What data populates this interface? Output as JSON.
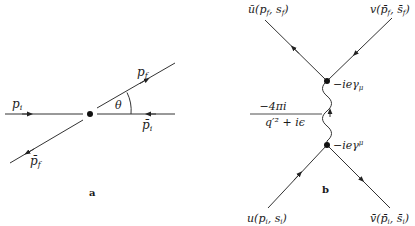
{
  "panel_a": {
    "caption": "a",
    "labels": {
      "p_i": "p",
      "p_i_sub": "i",
      "p_f": "p",
      "p_f_sub": "f",
      "pbar_i": "p̄",
      "pbar_i_sub": "i",
      "pbar_f": "p̄",
      "pbar_f_sub": "f",
      "theta": "θ"
    }
  },
  "panel_b": {
    "caption": "b",
    "labels": {
      "top_left": "ū(p",
      "top_left_sub1": "f",
      "top_left_mid": ", s",
      "top_left_sub2": "f",
      "top_left_end": ")",
      "top_right": "v(p̄",
      "top_right_sub1": "f",
      "top_right_mid": ", s̄",
      "top_right_sub2": "f",
      "top_right_end": ")",
      "bottom_left": "u(p",
      "bottom_left_sub1": "i",
      "bottom_left_mid": ", s",
      "bottom_left_sub2": "i",
      "bottom_left_end": ")",
      "bottom_right": "v̄(p̄",
      "bottom_right_sub1": "i",
      "bottom_right_mid": ", s̄",
      "bottom_right_sub2": "i",
      "bottom_right_end": ")",
      "vertex_upper": "−ieγ",
      "vertex_upper_sub": "μ",
      "vertex_lower": "−ieγ",
      "vertex_lower_sup": "μ",
      "propagator_num": "−4πi",
      "propagator_den": "q′² + iϵ"
    }
  }
}
